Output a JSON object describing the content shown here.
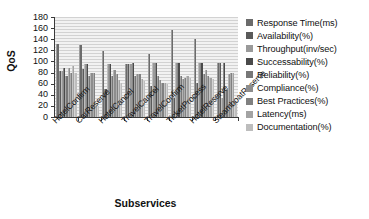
{
  "chart_data": {
    "type": "bar",
    "title": "",
    "xlabel": "Subservices",
    "ylabel": "QoS",
    "ylim": [
      0,
      180
    ],
    "yticks": [
      180,
      160,
      140,
      120,
      100,
      80,
      60,
      40,
      20,
      0
    ],
    "grid": true,
    "legend_position": "right",
    "categories": [
      "HotelConfirm",
      "CarReserve",
      "HotelCancel",
      "TravelCancel",
      "TravelConfirm",
      "TicketProcess",
      "HotelReserve",
      "SteamboatReserve"
    ],
    "series": [
      {
        "name": "Response Time(ms)",
        "color": "#6b6b6b",
        "values": [
          131,
          129,
          118,
          96,
          114,
          157,
          140,
          98
        ]
      },
      {
        "name": "Availability(%)",
        "color": "#5a5a5a",
        "values": [
          83,
          86,
          51,
          96,
          56,
          34,
          62,
          97
        ]
      },
      {
        "name": "Throughput(inv/sec)",
        "color": "#9a9a9a",
        "values": [
          82,
          95,
          95,
          96,
          97,
          98,
          97,
          35
        ]
      },
      {
        "name": "Successability(%)",
        "color": "#4a4a4a",
        "values": [
          89,
          96,
          95,
          97,
          97,
          98,
          98,
          97
        ]
      },
      {
        "name": "Reliability(%)",
        "color": "#777777",
        "values": [
          73,
          73,
          73,
          73,
          73,
          73,
          78,
          49
        ]
      },
      {
        "name": "Compliance(%)",
        "color": "#8d8d8d",
        "values": [
          89,
          80,
          84,
          78,
          67,
          68,
          85,
          78
        ]
      },
      {
        "name": "Best Practices(%)",
        "color": "#808080",
        "values": [
          80,
          80,
          78,
          78,
          62,
          70,
          73,
          80
        ]
      },
      {
        "name": "Latency(ms)",
        "color": "#a3a3a3",
        "values": [
          92,
          20,
          66,
          68,
          62,
          73,
          70,
          80
        ]
      },
      {
        "name": "Documentation(%)",
        "color": "#bdbdbd",
        "values": [
          79,
          20,
          62,
          64,
          60,
          70,
          68,
          26
        ]
      }
    ]
  }
}
